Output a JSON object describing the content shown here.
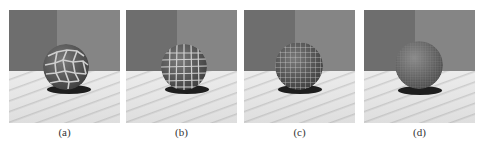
{
  "figure": {
    "panels": [
      {
        "id": "a",
        "caption": "(a)",
        "cell_count": "large",
        "pattern": "coarse voronoi cracks"
      },
      {
        "id": "b",
        "caption": "(b)",
        "cell_count": "medium",
        "pattern": "medium voronoi cracks"
      },
      {
        "id": "c",
        "caption": "(c)",
        "cell_count": "small",
        "pattern": "fine voronoi cracks"
      },
      {
        "id": "d",
        "caption": "(d)",
        "cell_count": "very small",
        "pattern": "very fine texture"
      }
    ],
    "colors": {
      "wall_left": "#6e6e6e",
      "wall_right": "#858585",
      "floor": "#e4e4e4",
      "sphere": "#5a5a5a",
      "cracks": "#c8c8c8",
      "shadow": "#1e1e1e"
    }
  }
}
